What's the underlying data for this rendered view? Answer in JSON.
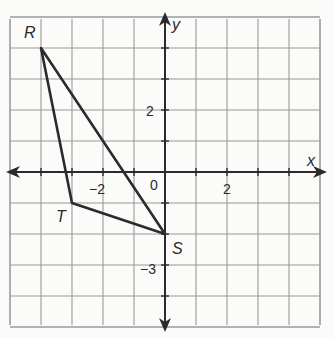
{
  "diagram": {
    "type": "coordinate-plane",
    "grid": {
      "x_min": -5,
      "x_max": 5,
      "y_min": -5,
      "y_max": 5,
      "unit_px": 31,
      "origin_px": [
        165,
        172
      ]
    },
    "axes": {
      "x_label": "x",
      "y_label": "y"
    },
    "tick_labels": {
      "x": [
        {
          "value": -2,
          "text": "−2"
        },
        {
          "value": 2,
          "text": "2"
        }
      ],
      "y": [
        {
          "value": 2,
          "text": "2"
        },
        {
          "value": -3,
          "text": "−3"
        }
      ],
      "origin": "0"
    },
    "points": [
      {
        "name": "R",
        "x": -4,
        "y": 4
      },
      {
        "name": "T",
        "x": -3,
        "y": -1
      },
      {
        "name": "S",
        "x": 0,
        "y": -2
      }
    ],
    "polygon": [
      "R",
      "T",
      "S"
    ],
    "colors": {
      "grid": "#9a9a9a",
      "axis": "#2b2b2b",
      "shape": "#2b2b2b",
      "background": "#fbfbf9"
    }
  }
}
